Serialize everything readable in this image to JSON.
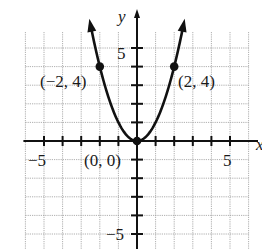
{
  "chart_data": {
    "type": "line",
    "title": "",
    "function": "y = x^2",
    "xlabel": "x",
    "ylabel": "y",
    "xlim": [
      -6,
      6
    ],
    "ylim": [
      -6,
      6
    ],
    "grid": true,
    "x_tick_labels": [
      "-5",
      "5"
    ],
    "y_tick_labels": [
      "5",
      "-5"
    ],
    "series": [
      {
        "name": "parabola",
        "x": [
          -2.6,
          -2,
          -1.5,
          -1,
          -0.5,
          0,
          0.5,
          1,
          1.5,
          2,
          2.6
        ],
        "y": [
          6.76,
          4,
          2.25,
          1,
          0.25,
          0,
          0.25,
          1,
          2.25,
          4,
          6.76
        ]
      }
    ],
    "points": [
      {
        "x": -2,
        "y": 4,
        "label": "(−2, 4)"
      },
      {
        "x": 0,
        "y": 0,
        "label": "(0, 0)"
      },
      {
        "x": 2,
        "y": 4,
        "label": "(2, 4)"
      }
    ]
  },
  "labels": {
    "y_axis": "y",
    "x_axis": "x",
    "tick_x_neg5": "−5",
    "tick_x_pos5": "5",
    "tick_y_pos5": "5",
    "tick_y_neg5": "−5",
    "point_left": "(−2, 4)",
    "point_origin": "(0, 0)",
    "point_right": "(2, 4)"
  }
}
